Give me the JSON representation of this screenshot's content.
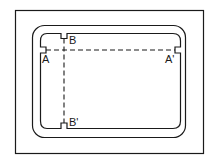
{
  "diagram": {
    "stroke_color": "#1a1a1a",
    "background": "#ffffff",
    "labels": {
      "a": "A",
      "a_prime": "A'",
      "b": "B",
      "b_prime": "B'"
    },
    "section_lines": [
      {
        "id": "A-A'",
        "orientation": "horizontal",
        "from": "A",
        "to": "A'"
      },
      {
        "id": "B-B'",
        "orientation": "vertical",
        "from": "B",
        "to": "B'"
      }
    ]
  }
}
